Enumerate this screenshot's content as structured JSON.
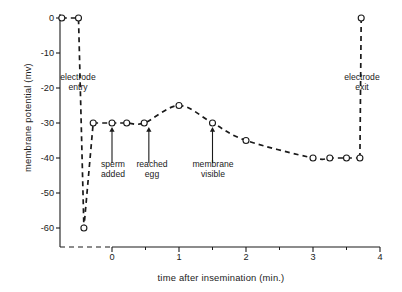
{
  "figure": {
    "background": "#ffffff",
    "ink_color": "#1a1a1a"
  },
  "chart_data": {
    "type": "line",
    "title": "",
    "xlabel": "time after insemination (min.)",
    "ylabel": "membrane potential (mv)",
    "xlim": [
      -0.78,
      4.0
    ],
    "ylim": [
      -65,
      2
    ],
    "xticks": [
      0,
      1,
      2,
      3,
      4
    ],
    "xtick_labels": [
      "0",
      "1",
      "2",
      "3",
      "4"
    ],
    "xminor_ticks": [
      0.5,
      1.5,
      2.5,
      3.5
    ],
    "yticks": [
      0,
      -10,
      -20,
      -30,
      -40,
      -50,
      -60
    ],
    "ytick_labels": [
      "0",
      "-10",
      "-20",
      "-30",
      "-40",
      "-50",
      "-60"
    ],
    "grid": false,
    "legend": null,
    "line_style": "dashed",
    "marker": "open-circle",
    "x": [
      -0.75,
      -0.5,
      -0.42,
      -0.28,
      0.0,
      0.22,
      0.48,
      1.0,
      1.5,
      2.0,
      3.0,
      3.25,
      3.5,
      3.7,
      3.72
    ],
    "y": [
      0,
      0,
      -60,
      -30,
      -30,
      -30,
      -30,
      -25,
      -30,
      -35,
      -40,
      -40,
      -40,
      -40,
      0
    ],
    "points": [
      {
        "x": -0.75,
        "y": 0
      },
      {
        "x": -0.5,
        "y": 0
      },
      {
        "x": -0.42,
        "y": -60
      },
      {
        "x": -0.28,
        "y": -30
      },
      {
        "x": 0.0,
        "y": -30
      },
      {
        "x": 0.22,
        "y": -30
      },
      {
        "x": 0.48,
        "y": -30
      },
      {
        "x": 1.0,
        "y": -25
      },
      {
        "x": 1.5,
        "y": -30
      },
      {
        "x": 2.0,
        "y": -35
      },
      {
        "x": 3.0,
        "y": -40
      },
      {
        "x": 3.25,
        "y": -40
      },
      {
        "x": 3.5,
        "y": -40
      },
      {
        "x": 3.7,
        "y": -40
      },
      {
        "x": 3.72,
        "y": 0
      }
    ],
    "annotations": [
      {
        "id": "electrode-entry",
        "text_line1": "electrode",
        "text_line2": "entry",
        "x": -0.55,
        "y": -15,
        "arrow": false
      },
      {
        "id": "sperm-added",
        "text_line1": "sperm",
        "text_line2": "added",
        "x": 0.0,
        "y": -40,
        "arrow": true,
        "arrow_to_y": -31
      },
      {
        "id": "reached-egg",
        "text_line1": "reached",
        "text_line2": "egg",
        "x": 0.55,
        "y": -40,
        "arrow": true,
        "arrow_to_y": -31
      },
      {
        "id": "membrane-visible",
        "text_line1": "membrane",
        "text_line2": "visible",
        "x": 1.5,
        "y": -40,
        "arrow": true,
        "arrow_to_y": -31
      },
      {
        "id": "electrode-exit",
        "text_line1": "electrode",
        "text_line2": "exit",
        "x": 3.45,
        "y": -15,
        "arrow": false
      }
    ]
  },
  "axes": {
    "y_title": "membrane potential (mv)",
    "x_title": "time after insemination (min.)",
    "y_tick_labels": [
      "0",
      "-10",
      "-20",
      "-30",
      "-40",
      "-50",
      "-60"
    ],
    "x_tick_labels": [
      "0",
      "1",
      "2",
      "3",
      "4"
    ]
  },
  "annotation_text": {
    "electrode_entry_1": "electrode",
    "electrode_entry_2": "entry",
    "sperm_added_1": "sperm",
    "sperm_added_2": "added",
    "reached_egg_1": "reached",
    "reached_egg_2": "egg",
    "membrane_visible_1": "membrane",
    "membrane_visible_2": "visible",
    "electrode_exit_1": "electrode",
    "electrode_exit_2": "exit"
  }
}
